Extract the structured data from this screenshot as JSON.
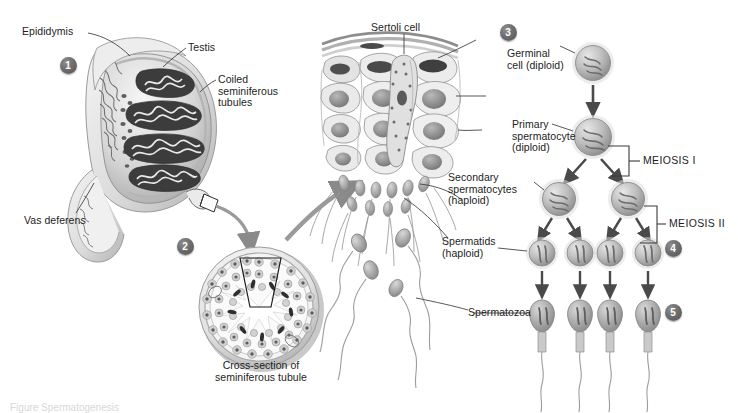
{
  "figure": {
    "background_color": "#ffffff",
    "ink_color": "#1d1d1d",
    "badge_color": "#5e5e5e"
  },
  "steps": [
    {
      "number": "1",
      "x": 68,
      "y": 65
    },
    {
      "number": "2",
      "x": 185,
      "y": 246
    },
    {
      "number": "3",
      "x": 508,
      "y": 32
    },
    {
      "number": "4",
      "x": 673,
      "y": 248
    },
    {
      "number": "5",
      "x": 673,
      "y": 312
    }
  ],
  "labels": {
    "epididymis": "Epididymis",
    "testis": "Testis",
    "coiled_seminiferous_tubules": "Coiled\nseminiferous\ntubules",
    "vas_deferens": "Vas deferens",
    "cross_section_caption": "Cross-section of\nseminiferous tubule",
    "sertoli_cell": "Sertoli cell",
    "germinal_cell": "Germinal\ncell (diploid)",
    "primary_spermatocyte": "Primary\nspermatocyte\n(diploid)",
    "secondary_spermatocytes": "Secondary\nspermatocytes\n(haploid)",
    "spermatids": "Spermatids\n(haploid)",
    "spermatozoa": "Spermatozoa",
    "meiosis_one": "MEIOSIS I",
    "meiosis_two": "MEIOSIS II"
  },
  "lineage": {
    "rows": [
      {
        "stage": "Germinal cell (diploid)",
        "ploidy": "diploid",
        "count": 1
      },
      {
        "stage": "Primary spermatocyte (diploid)",
        "ploidy": "diploid",
        "count": 1
      },
      {
        "stage": "Secondary spermatocytes (haploid)",
        "ploidy": "haploid",
        "count": 2
      },
      {
        "stage": "Spermatids (haploid)",
        "ploidy": "haploid",
        "count": 4
      },
      {
        "stage": "Spermatozoa",
        "ploidy": "haploid",
        "count": 4
      }
    ],
    "divisions": [
      "MEIOSIS I",
      "MEIOSIS II"
    ]
  },
  "bottom_caption": "Figure    Spermatogenesis"
}
